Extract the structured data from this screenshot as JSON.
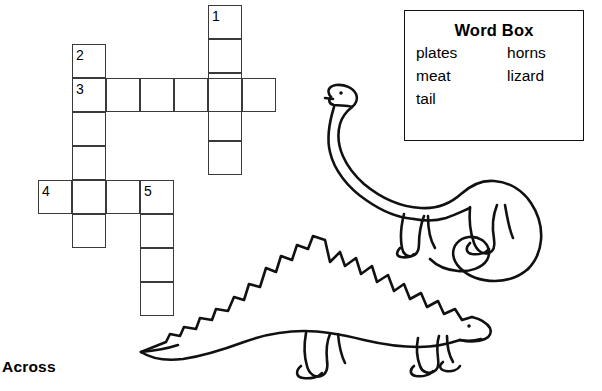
{
  "worksheet": {
    "across_heading": "Across"
  },
  "word_box": {
    "title": "Word Box",
    "rows": [
      {
        "left": "plates",
        "right": "horns"
      },
      {
        "left": "meat",
        "right": "lizard"
      },
      {
        "left": "tail",
        "right": ""
      }
    ],
    "words": [
      "plates",
      "horns",
      "meat",
      "lizard",
      "tail"
    ]
  },
  "crossword": {
    "cell_size": 34,
    "numbers": [
      {
        "label": "1",
        "x": 212,
        "y": 9
      },
      {
        "label": "2",
        "x": 76,
        "y": 48
      },
      {
        "label": "3",
        "x": 76,
        "y": 82
      },
      {
        "label": "4",
        "x": 42,
        "y": 184
      },
      {
        "label": "5",
        "x": 144,
        "y": 184
      }
    ],
    "entries": [
      {
        "number": "1",
        "direction": "down",
        "length": 5,
        "start_x": 208,
        "start_y": 5
      },
      {
        "number": "2",
        "direction": "down",
        "length": 6,
        "start_x": 72,
        "start_y": 44
      },
      {
        "number": "3",
        "direction": "across",
        "length": 6,
        "start_x": 72,
        "start_y": 78
      },
      {
        "number": "4",
        "direction": "across",
        "length": 4,
        "start_x": 38,
        "start_y": 180
      },
      {
        "number": "5",
        "direction": "down",
        "length": 4,
        "start_x": 140,
        "start_y": 180
      }
    ]
  },
  "illustrations": [
    {
      "name": "sauropod-dinosaur"
    },
    {
      "name": "stegosaurus-dinosaur"
    }
  ],
  "colors": {
    "ink": "#000000",
    "grid_line": "#3a3a3a",
    "paper": "#ffffff"
  }
}
